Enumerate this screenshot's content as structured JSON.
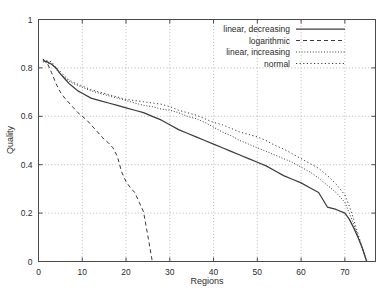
{
  "chart_data": {
    "type": "line",
    "title": "",
    "xlabel": "Regions",
    "ylabel": "Quality",
    "xlim": [
      0,
      77
    ],
    "ylim": [
      0,
      1
    ],
    "xticks": [
      0,
      10,
      20,
      30,
      40,
      50,
      60,
      70
    ],
    "yticks": [
      "0",
      "0.2",
      "0.4",
      "0.6",
      "0.8",
      "1"
    ],
    "ytick_values": [
      0,
      0.2,
      0.4,
      0.6,
      0.8,
      1
    ],
    "grid": true,
    "legend_position": "top-right",
    "line_color": "#3c3c3c",
    "series": [
      {
        "name": "linear, decreasing",
        "style": "solid",
        "dash": "none",
        "x": [
          1,
          2,
          3,
          4,
          5,
          6,
          7,
          8,
          9,
          10,
          12,
          14,
          16,
          18,
          20,
          22,
          24,
          26,
          28,
          30,
          32,
          34,
          36,
          38,
          40,
          42,
          44,
          46,
          48,
          50,
          52,
          54,
          56,
          58,
          60,
          62,
          64,
          65,
          66,
          68,
          70,
          71,
          72,
          73,
          74,
          75
        ],
        "y": [
          0.83,
          0.825,
          0.815,
          0.8,
          0.775,
          0.755,
          0.735,
          0.72,
          0.705,
          0.695,
          0.675,
          0.665,
          0.655,
          0.645,
          0.635,
          0.625,
          0.615,
          0.6,
          0.585,
          0.565,
          0.545,
          0.53,
          0.515,
          0.5,
          0.485,
          0.47,
          0.455,
          0.44,
          0.425,
          0.41,
          0.395,
          0.375,
          0.355,
          0.34,
          0.325,
          0.305,
          0.285,
          0.255,
          0.225,
          0.215,
          0.2,
          0.175,
          0.14,
          0.1,
          0.055,
          0.0
        ]
      },
      {
        "name": "logarithmic",
        "style": "dashed",
        "dash": "4 3",
        "x": [
          1,
          2,
          3,
          4,
          5,
          6,
          7,
          8,
          9,
          10,
          11,
          12,
          13,
          14,
          15,
          16,
          17,
          18,
          19,
          20,
          21,
          22,
          23,
          24,
          25,
          26
        ],
        "y": [
          0.835,
          0.82,
          0.78,
          0.735,
          0.7,
          0.675,
          0.655,
          0.635,
          0.615,
          0.6,
          0.585,
          0.565,
          0.545,
          0.525,
          0.505,
          0.49,
          0.47,
          0.435,
          0.37,
          0.33,
          0.305,
          0.285,
          0.245,
          0.205,
          0.105,
          0.0
        ]
      },
      {
        "name": "linear, increasing",
        "style": "fine-dotted",
        "dash": "1 1.8",
        "x": [
          1,
          2,
          3,
          4,
          5,
          6,
          7,
          8,
          10,
          12,
          14,
          16,
          18,
          20,
          22,
          24,
          26,
          28,
          30,
          32,
          34,
          36,
          38,
          40,
          42,
          44,
          46,
          48,
          50,
          52,
          54,
          56,
          58,
          60,
          62,
          64,
          66,
          68,
          70,
          71,
          72,
          73,
          74,
          75
        ],
        "y": [
          0.825,
          0.82,
          0.815,
          0.795,
          0.775,
          0.76,
          0.745,
          0.735,
          0.72,
          0.705,
          0.695,
          0.685,
          0.675,
          0.665,
          0.655,
          0.645,
          0.64,
          0.63,
          0.625,
          0.615,
          0.6,
          0.59,
          0.575,
          0.555,
          0.535,
          0.52,
          0.5,
          0.485,
          0.47,
          0.455,
          0.44,
          0.425,
          0.41,
          0.39,
          0.37,
          0.345,
          0.315,
          0.285,
          0.245,
          0.2,
          0.155,
          0.105,
          0.055,
          0.0
        ]
      },
      {
        "name": "normal",
        "style": "dotted",
        "dash": "1.2 2.4",
        "x": [
          1,
          2,
          3,
          4,
          5,
          6,
          7,
          8,
          10,
          12,
          14,
          16,
          18,
          20,
          22,
          24,
          26,
          28,
          30,
          32,
          34,
          36,
          38,
          40,
          42,
          44,
          46,
          48,
          50,
          52,
          54,
          56,
          58,
          60,
          62,
          64,
          66,
          68,
          70,
          71,
          72,
          73,
          74,
          75
        ],
        "y": [
          0.835,
          0.83,
          0.825,
          0.8,
          0.785,
          0.765,
          0.75,
          0.74,
          0.725,
          0.71,
          0.7,
          0.69,
          0.68,
          0.67,
          0.665,
          0.66,
          0.655,
          0.65,
          0.64,
          0.625,
          0.615,
          0.605,
          0.59,
          0.575,
          0.565,
          0.55,
          0.535,
          0.525,
          0.515,
          0.5,
          0.48,
          0.465,
          0.445,
          0.425,
          0.405,
          0.385,
          0.355,
          0.32,
          0.275,
          0.23,
          0.175,
          0.115,
          0.055,
          0.0
        ]
      }
    ]
  },
  "legend": {
    "entries": [
      {
        "label": "linear, decreasing"
      },
      {
        "label": "logarithmic"
      },
      {
        "label": "linear, increasing"
      },
      {
        "label": "normal"
      }
    ]
  }
}
